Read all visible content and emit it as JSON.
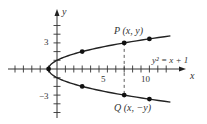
{
  "chart_data": {
    "type": "line",
    "title": "",
    "xlabel": "x",
    "ylabel": "y",
    "equation_label": "y² = x + 1",
    "xlim": [
      -6,
      14
    ],
    "ylim": [
      -6,
      7
    ],
    "x_ticks": [
      -5,
      -4,
      -3,
      -2,
      -1,
      1,
      2,
      3,
      4,
      5,
      6,
      7,
      8,
      9,
      10,
      11,
      12,
      13
    ],
    "x_tick_labels": [
      {
        "value": 5,
        "label": "5"
      },
      {
        "value": 10,
        "label": "10"
      }
    ],
    "y_ticks": [
      -5,
      -4,
      -3,
      -2,
      -1,
      1,
      2,
      3,
      4,
      5
    ],
    "y_tick_labels": [
      {
        "value": 3,
        "label": "3"
      },
      {
        "value": -3,
        "label": "−3"
      }
    ],
    "grid": false,
    "series": [
      {
        "name": "y^2 = x + 1",
        "curve": "parabola",
        "vertex": [
          -1,
          0
        ],
        "x_range": [
          -1,
          13.5
        ]
      }
    ],
    "marked_points": [
      {
        "x": -1,
        "y": 0
      },
      {
        "x": 3,
        "y": 2
      },
      {
        "x": 8,
        "y": 3,
        "label": "P (x, y)"
      },
      {
        "x": 11,
        "y": 3.46
      },
      {
        "x": 3,
        "y": -2
      },
      {
        "x": 8,
        "y": -3,
        "label": "Q (x, −y)"
      },
      {
        "x": 11,
        "y": -3.46
      }
    ],
    "annotations": [
      {
        "type": "dashed-vertical",
        "x": 8,
        "from_y": -3,
        "to_y": 3
      }
    ]
  },
  "labels": {
    "x_axis": "x",
    "y_axis": "y",
    "tick_5": "5",
    "tick_10": "10",
    "tick_3": "3",
    "tick_neg3": "−3",
    "point_p": "P (x, y)",
    "point_q": "Q (x, −y)",
    "equation": "y² = x + 1"
  }
}
